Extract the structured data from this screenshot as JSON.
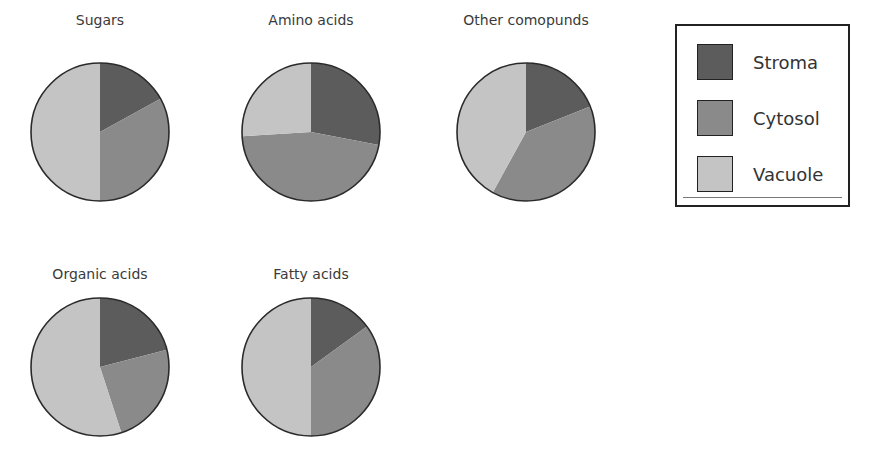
{
  "chart_data": {
    "type": "pie",
    "categories": [
      "Stroma",
      "Cytosol",
      "Vacuole"
    ],
    "colors": {
      "Stroma": "#5c5c5c",
      "Cytosol": "#8a8a8a",
      "Vacuole": "#c4c4c4"
    },
    "series": [
      {
        "name": "Sugars",
        "values": [
          17,
          33,
          50
        ]
      },
      {
        "name": "Amino acids",
        "values": [
          28,
          46,
          26
        ]
      },
      {
        "name": "Other comopunds",
        "values": [
          19,
          39,
          42
        ]
      },
      {
        "name": "Organic acids",
        "values": [
          21,
          24,
          55
        ]
      },
      {
        "name": "Fatty acids",
        "values": [
          15,
          35,
          50
        ]
      }
    ],
    "legend": {
      "position": "right",
      "entries": [
        "Stroma",
        "Cytosol",
        "Vacuole"
      ]
    },
    "unit": "percent (estimated from wedge angles)"
  },
  "pies": [
    {
      "title": "Sugars"
    },
    {
      "title": "Amino acids"
    },
    {
      "title": "Other comopunds"
    },
    {
      "title": "Organic acids"
    },
    {
      "title": "Fatty acids"
    }
  ],
  "legend": {
    "items": [
      {
        "label": "Stroma"
      },
      {
        "label": "Cytosol"
      },
      {
        "label": "Vacuole"
      }
    ]
  }
}
